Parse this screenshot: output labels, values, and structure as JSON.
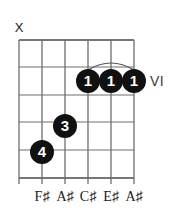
{
  "diagram": {
    "type": "guitar-chord-diagram",
    "position_label": "VI",
    "strings": 6,
    "frets": 5,
    "grid": {
      "left": 19,
      "right": 134,
      "top": 40,
      "bottom": 178,
      "string_x": [
        19,
        42,
        65,
        88,
        111,
        134
      ],
      "fret_y": [
        40,
        67,
        95,
        122,
        150,
        178
      ]
    },
    "open_mute_markers": [
      {
        "symbol": "X",
        "string_index": 0,
        "x": 19,
        "y": 26
      }
    ],
    "dots": [
      {
        "label": "1",
        "string_index": 3,
        "fret": 2,
        "x": 88,
        "y": 81
      },
      {
        "label": "1",
        "string_index": 4,
        "fret": 2,
        "x": 111,
        "y": 81
      },
      {
        "label": "1",
        "string_index": 5,
        "fret": 2,
        "x": 134,
        "y": 81
      },
      {
        "label": "3",
        "string_index": 2,
        "fret": 4,
        "x": 65,
        "y": 126
      },
      {
        "label": "4",
        "string_index": 1,
        "fret": 5,
        "x": 42,
        "y": 152
      }
    ],
    "barre": {
      "from_string_index": 3,
      "to_string_index": 5,
      "fret": 2,
      "x1": 88,
      "x2": 134,
      "y": 69,
      "arc_height": 11
    },
    "note_labels": [
      {
        "text": "F♯",
        "string_index": 1,
        "x": 42
      },
      {
        "text": "A♯",
        "string_index": 2,
        "x": 65
      },
      {
        "text": "C♯",
        "string_index": 3,
        "x": 88
      },
      {
        "text": "E♯",
        "string_index": 4,
        "x": 111
      },
      {
        "text": "A♯",
        "string_index": 5,
        "x": 134
      }
    ],
    "note_label_y": 190,
    "colors": {
      "background": "#ffffff",
      "grid_line": "#6e6e6e",
      "grid_line_outer": "#4a4a4a",
      "dot_fill": "#111111",
      "dot_text": "#ffffff",
      "text": "#1a1a1a",
      "position_text": "#3a3a3a"
    }
  }
}
